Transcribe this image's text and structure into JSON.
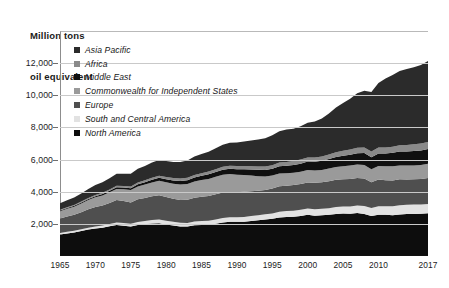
{
  "chart": {
    "axis_title_line1": "Million tons",
    "axis_title_line2": "oil equivalent"
  },
  "chart_data": {
    "type": "area",
    "stacked": true,
    "title": "",
    "subtitle": "",
    "xlabel": "",
    "ylabel": "Million tons oil equivalent",
    "grid": true,
    "legend_position": "top-left inside plot",
    "xlim": [
      1965,
      2017
    ],
    "ylim": [
      0,
      14000
    ],
    "ytick_values": [
      2000,
      4000,
      6000,
      8000,
      10000,
      12000
    ],
    "ytick_labels": [
      "2,000",
      "4,000",
      "6,000",
      "8,000",
      "10,000",
      "12,000"
    ],
    "xtick_values": [
      1965,
      1970,
      1975,
      1980,
      1985,
      1990,
      1995,
      2000,
      2005,
      2010,
      2017
    ],
    "xtick_labels": [
      "1965",
      "1970",
      "1975",
      "1980",
      "1985",
      "1990",
      "1995",
      "2000",
      "2005",
      "2010",
      "2017"
    ],
    "x": [
      1965,
      1966,
      1967,
      1968,
      1969,
      1970,
      1971,
      1972,
      1973,
      1974,
      1975,
      1976,
      1977,
      1978,
      1979,
      1980,
      1981,
      1982,
      1983,
      1984,
      1985,
      1986,
      1987,
      1988,
      1989,
      1990,
      1991,
      1992,
      1993,
      1994,
      1995,
      1996,
      1997,
      1998,
      1999,
      2000,
      2001,
      2002,
      2003,
      2004,
      2005,
      2006,
      2007,
      2008,
      2009,
      2010,
      2011,
      2012,
      2013,
      2014,
      2015,
      2016,
      2017
    ],
    "legend": [
      "Asia Pacific",
      "Africa",
      "Middle East",
      "Commonwealth for Independent States",
      "Europe",
      "South and Central America",
      "North America"
    ],
    "series": [
      {
        "name": "North America",
        "color": "#0d0d0d",
        "stack_order": 1,
        "values": [
          1340,
          1405,
          1470,
          1555,
          1645,
          1715,
          1760,
          1845,
          1930,
          1885,
          1830,
          1935,
          1985,
          2030,
          2045,
          1960,
          1900,
          1840,
          1830,
          1915,
          1930,
          1945,
          2005,
          2090,
          2130,
          2125,
          2130,
          2185,
          2220,
          2270,
          2315,
          2395,
          2430,
          2445,
          2495,
          2560,
          2510,
          2540,
          2565,
          2620,
          2640,
          2625,
          2670,
          2620,
          2490,
          2570,
          2560,
          2540,
          2590,
          2620,
          2620,
          2625,
          2660
        ]
      },
      {
        "name": "South and Central America",
        "color": "#e2e2e2",
        "stack_order": 2,
        "values": [
          95,
          100,
          105,
          112,
          120,
          128,
          136,
          147,
          160,
          168,
          175,
          188,
          198,
          210,
          222,
          228,
          228,
          230,
          228,
          236,
          242,
          252,
          262,
          272,
          278,
          282,
          290,
          300,
          310,
          322,
          337,
          352,
          368,
          378,
          382,
          396,
          396,
          398,
          405,
          425,
          442,
          458,
          478,
          495,
          492,
          520,
          535,
          550,
          565,
          575,
          578,
          572,
          578
        ]
      },
      {
        "name": "Europe",
        "color": "#4f4f4f",
        "stack_order": 3,
        "values": [
          900,
          950,
          985,
          1060,
          1140,
          1205,
          1245,
          1310,
          1390,
          1365,
          1330,
          1405,
          1430,
          1475,
          1520,
          1480,
          1430,
          1420,
          1435,
          1470,
          1515,
          1540,
          1575,
          1585,
          1580,
          1560,
          1580,
          1545,
          1535,
          1520,
          1545,
          1590,
          1580,
          1595,
          1600,
          1625,
          1645,
          1645,
          1680,
          1695,
          1700,
          1710,
          1700,
          1700,
          1610,
          1665,
          1620,
          1615,
          1615,
          1565,
          1580,
          1595,
          1610
        ]
      },
      {
        "name": "Commonwealth for Independent States",
        "color": "#9a9a9a",
        "stack_order": 4,
        "values": [
          455,
          482,
          510,
          540,
          572,
          600,
          630,
          662,
          695,
          730,
          765,
          800,
          830,
          865,
          895,
          920,
          940,
          960,
          985,
          1010,
          1035,
          1060,
          1085,
          1105,
          1110,
          1085,
          1040,
          975,
          905,
          830,
          805,
          800,
          765,
          760,
          765,
          770,
          775,
          775,
          790,
          800,
          810,
          835,
          845,
          855,
          800,
          840,
          865,
          875,
          865,
          865,
          855,
          865,
          885
        ]
      },
      {
        "name": "Middle East",
        "color": "#101010",
        "stack_order": 5,
        "values": [
          42,
          47,
          52,
          58,
          65,
          72,
          80,
          90,
          100,
          110,
          122,
          138,
          152,
          168,
          182,
          192,
          205,
          220,
          238,
          255,
          268,
          285,
          298,
          312,
          330,
          345,
          360,
          378,
          395,
          412,
          430,
          448,
          468,
          488,
          505,
          525,
          545,
          568,
          590,
          618,
          648,
          675,
          705,
          738,
          755,
          785,
          805,
          840,
          860,
          880,
          900,
          915,
          925
        ]
      },
      {
        "name": "Africa",
        "color": "#8a8a8a",
        "stack_order": 6,
        "values": [
          48,
          52,
          56,
          60,
          66,
          72,
          77,
          83,
          90,
          95,
          100,
          108,
          115,
          122,
          130,
          138,
          143,
          149,
          152,
          158,
          165,
          172,
          178,
          184,
          190,
          196,
          202,
          206,
          210,
          215,
          222,
          230,
          238,
          244,
          250,
          258,
          265,
          272,
          282,
          295,
          308,
          318,
          332,
          345,
          352,
          368,
          372,
          385,
          395,
          405,
          415,
          425,
          438
        ]
      },
      {
        "name": "Asia Pacific",
        "color": "#2b2b2b",
        "stack_order": 7,
        "values": [
          405,
          440,
          465,
          510,
          560,
          620,
          660,
          700,
          760,
          760,
          790,
          850,
          890,
          945,
          985,
          1000,
          1010,
          1035,
          1075,
          1140,
          1190,
          1240,
          1300,
          1380,
          1430,
          1470,
          1530,
          1600,
          1680,
          1760,
          1860,
          1950,
          2020,
          2010,
          2080,
          2150,
          2230,
          2350,
          2560,
          2790,
          2970,
          3170,
          3390,
          3530,
          3700,
          4010,
          4290,
          4460,
          4620,
          4720,
          4790,
          4880,
          5030
        ]
      }
    ],
    "totals_note": "Top of stack rises from ~3,290 in 1965 to ~13,510 in 2017, with a visible dip in 2009.",
    "annotations": []
  }
}
